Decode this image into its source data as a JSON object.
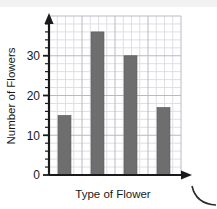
{
  "chart_data": {
    "type": "bar",
    "title": "",
    "subtitle": "",
    "xlabel": "Type of Flower",
    "ylabel": "Number of Flowers",
    "categories": [
      "",
      "",
      "",
      ""
    ],
    "values": [
      15,
      36,
      30,
      17
    ],
    "ylim": [
      0,
      40
    ],
    "xlim": [
      0,
      4
    ],
    "ytick_labels": [
      "0",
      "10",
      "20",
      "30"
    ],
    "ytick_values": [
      0,
      10,
      20,
      30
    ],
    "yminor_step": 2,
    "grid": true,
    "grid_minor": true,
    "legend": null,
    "legend_position": "none",
    "bar_color": "#6e6e6e",
    "bar_edge_color": "#5a5a5a",
    "axis_color": "#1a1a1a",
    "grid_major_color": "#b9b9c6",
    "grid_minor_color": "#dedee8",
    "background_color": "#ffffff",
    "annotations": [
      {
        "name": "y-axis-arrowhead",
        "shape": "arrow-up"
      },
      {
        "name": "x-axis-arrowhead",
        "shape": "arrow-right"
      },
      {
        "name": "corner-arc",
        "shape": "quarter-arc"
      }
    ]
  },
  "figure": {
    "y_axis_label": "Number of Flowers",
    "x_axis_label": "Type of Flower",
    "tick_0": "0",
    "tick_10": "10",
    "tick_20": "20",
    "tick_30": "30"
  }
}
